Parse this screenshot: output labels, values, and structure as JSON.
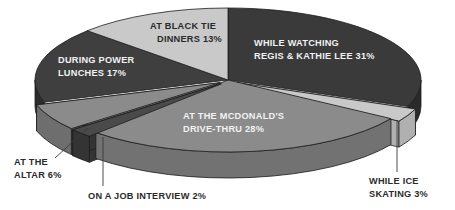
{
  "chart_data": {
    "type": "pie",
    "title": "",
    "subtitle": "",
    "xlabel": "",
    "ylabel": "",
    "legend_position": "none",
    "grid": false,
    "style": "3d-exploded-grayscale",
    "units": "percent",
    "total": 100,
    "categories": [
      "WHILE WATCHING REGIS & KATHIE LEE",
      "WHILE ICE SKATING",
      "AT THE MCDONALD'S DRIVE-THRU",
      "ON A JOB INTERVIEW",
      "AT THE ALTAR",
      "DURING POWER LUNCHES",
      "AT BLACK TIE DINNERS"
    ],
    "values": [
      31,
      3,
      28,
      2,
      6,
      17,
      13
    ],
    "slices": [
      {
        "id": "regis",
        "label_line1": "WHILE WATCHING",
        "label_line2": "REGIS & KATHIE LEE 31%",
        "value": 31,
        "color": "#3a3a3a",
        "side_color": "#2a2a2a",
        "text_color": "#f2f2f2",
        "label_placement": "inside",
        "exploded": false
      },
      {
        "id": "ice-skating",
        "label_line1": "WHILE ICE",
        "label_line2": "SKATING 3%",
        "value": 3,
        "color": "#c9c9c9",
        "side_color": "#b0b0b0",
        "text_color": "#2b2b2b",
        "label_placement": "callout",
        "exploded": true
      },
      {
        "id": "mcdonalds",
        "label_line1": "AT THE MCDONALD'S",
        "label_line2": "DRIVE-THRU 28%",
        "value": 28,
        "color": "#8b8b8b",
        "side_color": "#727272",
        "text_color": "#f2f2f2",
        "label_placement": "inside",
        "exploded": false
      },
      {
        "id": "job-interview",
        "label_line1": "ON A JOB INTERVIEW 2%",
        "label_line2": "",
        "value": 2,
        "color": "#4a4a4a",
        "side_color": "#343434",
        "text_color": "#2b2b2b",
        "label_placement": "callout",
        "exploded": true
      },
      {
        "id": "altar",
        "label_line1": "AT THE",
        "label_line2": "ALTAR 6%",
        "value": 6,
        "color": "#8b8b8b",
        "side_color": "#6e6e6e",
        "text_color": "#2b2b2b",
        "label_placement": "callout",
        "exploded": true
      },
      {
        "id": "power-lunches",
        "label_line1": "DURING POWER",
        "label_line2": "LUNCHES 17%",
        "value": 17,
        "color": "#3f3f3f",
        "side_color": "#2c2c2c",
        "text_color": "#f2f2f2",
        "label_placement": "inside",
        "exploded": false
      },
      {
        "id": "black-tie",
        "label_line1": "AT BLACK TIE",
        "label_line2": "DINNERS 13%",
        "value": 13,
        "color": "#c9c9c9",
        "side_color": "#aeaeae",
        "text_color": "#2b2b2b",
        "label_placement": "inside",
        "exploded": false
      }
    ]
  },
  "labels": {
    "regis": {
      "line1": "WHILE WATCHING",
      "line2": "REGIS & KATHIE LEE 31%"
    },
    "black_tie": {
      "line1": "AT BLACK TIE",
      "line2": "DINNERS 13%"
    },
    "power_lunches": {
      "line1": "DURING POWER",
      "line2": "LUNCHES 17%"
    },
    "mcdonalds": {
      "line1": "AT THE MCDONALD'S",
      "line2": "DRIVE-THRU 28%"
    },
    "altar": {
      "line1": "AT THE",
      "line2": "ALTAR 6%"
    },
    "job_interview": {
      "line1": "ON A JOB INTERVIEW 2%",
      "line2": ""
    },
    "ice_skating": {
      "line1": "WHILE ICE",
      "line2": "SKATING 3%"
    }
  },
  "colors": {
    "background": "#ffffff",
    "dark": "#3a3a3a",
    "medium": "#8b8b8b",
    "light": "#c9c9c9",
    "outline": "#1d1d1d",
    "text_on_dark": "#f2f2f2",
    "text_on_light": "#2b2b2b"
  }
}
